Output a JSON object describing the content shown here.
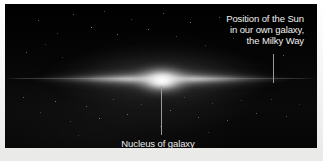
{
  "figure": {
    "kind": "astronomical-photograph-diagram",
    "plate_background_color": "#050505",
    "border_color": "#f4f4f2",
    "caption_color": "#f0f0f0",
    "leader_line_color": "#9a9a9a"
  },
  "annotations": {
    "sun": {
      "name": "sun-position-label",
      "lines": [
        "Position of the Sun",
        "in our own galaxy,",
        "the Milky Way"
      ],
      "pointer": {
        "orientation": "vertical",
        "x": 268,
        "y_start": 50,
        "y_end": 79
      }
    },
    "nucleus": {
      "name": "nucleus-label",
      "text": "Nucleus of galaxy",
      "pointer": {
        "orientation": "vertical",
        "x": 156,
        "y_start": 82,
        "y_end": 131
      }
    }
  },
  "galaxy": {
    "features": [
      "central bulge",
      "thin luminous disk",
      "diffuse halo",
      "background star field"
    ],
    "core_center": {
      "x": 157,
      "y": 79
    },
    "disk_extent": {
      "x_left": 20,
      "x_right": 300
    }
  },
  "stars": [
    {
      "x": 38,
      "y": 20,
      "s": 1.0,
      "o": 0.55
    },
    {
      "x": 57,
      "y": 33,
      "s": 0.9,
      "o": 0.4
    },
    {
      "x": 73,
      "y": 14,
      "s": 1.0,
      "o": 0.5
    },
    {
      "x": 91,
      "y": 27,
      "s": 1.2,
      "o": 0.72
    },
    {
      "x": 104,
      "y": 11,
      "s": 0.9,
      "o": 0.45
    },
    {
      "x": 117,
      "y": 34,
      "s": 1.0,
      "o": 0.55
    },
    {
      "x": 131,
      "y": 19,
      "s": 0.9,
      "o": 0.38
    },
    {
      "x": 148,
      "y": 29,
      "s": 1.1,
      "o": 0.6
    },
    {
      "x": 163,
      "y": 13,
      "s": 1.0,
      "o": 0.5
    },
    {
      "x": 176,
      "y": 36,
      "s": 0.9,
      "o": 0.42
    },
    {
      "x": 190,
      "y": 22,
      "s": 1.2,
      "o": 0.66
    },
    {
      "x": 205,
      "y": 45,
      "s": 0.9,
      "o": 0.4
    },
    {
      "x": 219,
      "y": 17,
      "s": 1.0,
      "o": 0.48
    },
    {
      "x": 233,
      "y": 38,
      "s": 0.9,
      "o": 0.36
    },
    {
      "x": 246,
      "y": 26,
      "s": 1.0,
      "o": 0.44
    },
    {
      "x": 283,
      "y": 55,
      "s": 1.0,
      "o": 0.5
    },
    {
      "x": 297,
      "y": 30,
      "s": 0.9,
      "o": 0.38
    },
    {
      "x": 26,
      "y": 52,
      "s": 1.0,
      "o": 0.46
    },
    {
      "x": 45,
      "y": 44,
      "s": 0.9,
      "o": 0.34
    },
    {
      "x": 62,
      "y": 57,
      "s": 0.9,
      "o": 0.32
    },
    {
      "x": 23,
      "y": 97,
      "s": 1.0,
      "o": 0.48
    },
    {
      "x": 40,
      "y": 112,
      "s": 0.9,
      "o": 0.36
    },
    {
      "x": 55,
      "y": 101,
      "s": 1.1,
      "o": 0.55
    },
    {
      "x": 70,
      "y": 121,
      "s": 0.9,
      "o": 0.34
    },
    {
      "x": 86,
      "y": 106,
      "s": 1.0,
      "o": 0.46
    },
    {
      "x": 99,
      "y": 118,
      "s": 1.2,
      "o": 0.62
    },
    {
      "x": 113,
      "y": 99,
      "s": 0.9,
      "o": 0.38
    },
    {
      "x": 127,
      "y": 114,
      "s": 1.0,
      "o": 0.5
    },
    {
      "x": 141,
      "y": 104,
      "s": 0.9,
      "o": 0.36
    },
    {
      "x": 170,
      "y": 110,
      "s": 1.1,
      "o": 0.58
    },
    {
      "x": 184,
      "y": 97,
      "s": 0.9,
      "o": 0.34
    },
    {
      "x": 198,
      "y": 117,
      "s": 1.0,
      "o": 0.48
    },
    {
      "x": 212,
      "y": 103,
      "s": 0.9,
      "o": 0.36
    },
    {
      "x": 227,
      "y": 120,
      "s": 1.0,
      "o": 0.44
    },
    {
      "x": 241,
      "y": 100,
      "s": 0.9,
      "o": 0.32
    },
    {
      "x": 256,
      "y": 113,
      "s": 1.0,
      "o": 0.46
    },
    {
      "x": 271,
      "y": 99,
      "s": 0.9,
      "o": 0.34
    },
    {
      "x": 286,
      "y": 116,
      "s": 1.0,
      "o": 0.42
    },
    {
      "x": 299,
      "y": 104,
      "s": 0.9,
      "o": 0.3
    },
    {
      "x": 160,
      "y": 126,
      "s": 0.9,
      "o": 0.36
    },
    {
      "x": 208,
      "y": 132,
      "s": 0.9,
      "o": 0.3
    },
    {
      "x": 78,
      "y": 135,
      "s": 0.9,
      "o": 0.28
    }
  ]
}
